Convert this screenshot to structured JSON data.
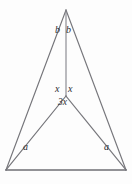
{
  "figure": {
    "kind": "geometry-diagram",
    "background_color": "#fdfdfd",
    "line_color": "#75757a",
    "label_color": "#2e2e32",
    "canvas": {
      "width": 132,
      "height": 184
    },
    "vertices": {
      "apex": {
        "x": 66,
        "y": 10
      },
      "inner": {
        "x": 66,
        "y": 96
      },
      "base_left": {
        "x": 6,
        "y": 170
      },
      "base_right": {
        "x": 126,
        "y": 170
      }
    },
    "segments": [
      {
        "name": "apex-to-base-left",
        "from": "apex",
        "to": "base_left"
      },
      {
        "name": "apex-to-base-right",
        "from": "apex",
        "to": "base_right"
      },
      {
        "name": "base",
        "from": "base_left",
        "to": "base_right"
      },
      {
        "name": "cevian-apex-to-inner",
        "from": "apex",
        "to": "inner"
      },
      {
        "name": "inner-to-base-left",
        "from": "inner",
        "to": "base_left"
      },
      {
        "name": "inner-to-base-right",
        "from": "inner",
        "to": "base_right"
      }
    ],
    "labels": {
      "b_left": "b",
      "b_right": "b",
      "x_left": "x",
      "x_right": "x",
      "three_x": "3x",
      "a_left": "a",
      "a_right": "a"
    }
  }
}
